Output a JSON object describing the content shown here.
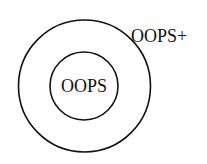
{
  "diagram": {
    "type": "nested-set",
    "outer": {
      "label": "OOPS+"
    },
    "inner": {
      "label": "OOPS"
    },
    "stroke_color": "#111111",
    "background": "#ffffff"
  }
}
